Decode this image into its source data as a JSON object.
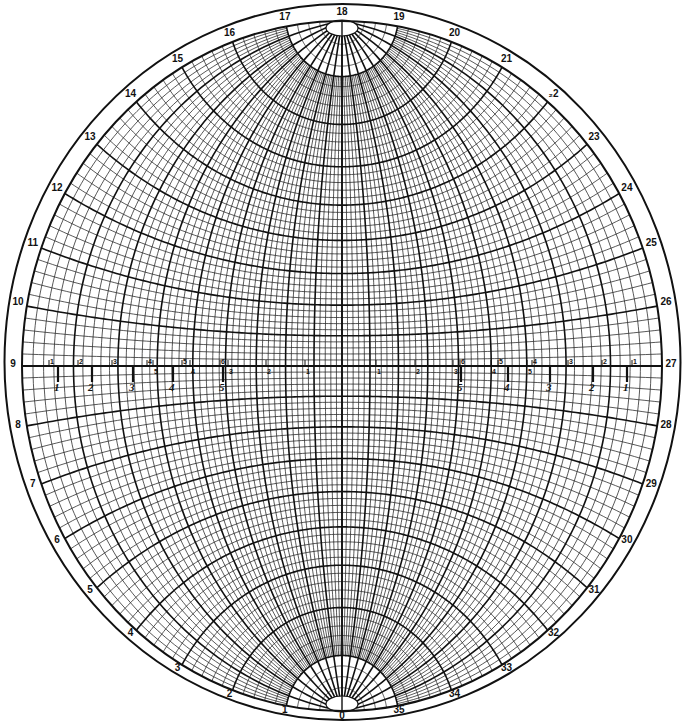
{
  "colors": {
    "ink": "#111111",
    "paper": "#ffffff"
  },
  "rim_scale": {
    "unit": "tens of degrees",
    "labels": [
      "0",
      "1",
      "2",
      "3",
      "4",
      "5",
      "6",
      "7",
      "8",
      "9",
      "10",
      "11",
      "12",
      "13",
      "14",
      "15",
      "16",
      "17",
      "18",
      "19",
      "20",
      "21",
      "22",
      "23",
      "24",
      "25",
      "26",
      "27",
      "28",
      "29",
      "30",
      "31",
      "32",
      "33",
      "34",
      "35"
    ],
    "misprinted_label_22": "₂2"
  },
  "grid": {
    "projection": "equal-angle (Wulff)",
    "minor_interval_deg": 2,
    "major_interval_deg": 10,
    "great_circles": "meridians through N-S poles",
    "small_circles": "parallels about N-S axis"
  },
  "equator_scale": {
    "left_upper_ticks": [
      "1",
      "2",
      "3",
      "4",
      "5",
      "6"
    ],
    "left_lower_ticks": [
      "5",
      "4",
      "3",
      "2",
      "1"
    ],
    "left_italic_marks": [
      "1",
      "2",
      "3",
      "4",
      "5"
    ],
    "right_upper_ticks": [
      "6",
      "5",
      "4",
      "3",
      "2",
      "1"
    ],
    "right_lower_ticks": [
      "1",
      "2",
      "3",
      "4",
      "5"
    ],
    "right_italic_marks": [
      "5",
      "4",
      "3",
      "2",
      "1"
    ]
  }
}
